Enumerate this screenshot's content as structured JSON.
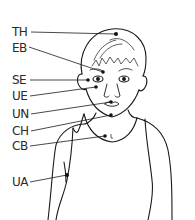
{
  "diagram": {
    "line_color": "#1a1a1a",
    "points": [
      {
        "label": "TH",
        "label_x": 12,
        "label_y": 26,
        "line_x1": 31,
        "line_y1": 32,
        "dot_x": 116,
        "dot_y": 34
      },
      {
        "label": "EB",
        "label_x": 12,
        "label_y": 42,
        "line_x1": 29,
        "line_y1": 47,
        "dot_x": 103,
        "dot_y": 72
      },
      {
        "label": "SE",
        "label_x": 12,
        "label_y": 74,
        "line_x1": 30,
        "line_y1": 80,
        "dot_x": 88,
        "dot_y": 80
      },
      {
        "label": "UE",
        "label_x": 12,
        "label_y": 90,
        "line_x1": 30,
        "line_y1": 96,
        "dot_x": 96,
        "dot_y": 87
      },
      {
        "label": "UN",
        "label_x": 12,
        "label_y": 106,
        "line_x1": 31,
        "line_y1": 114,
        "dot_x": 111,
        "dot_y": 102
      },
      {
        "label": "CH",
        "label_x": 12,
        "label_y": 125,
        "line_x1": 31,
        "line_y1": 131,
        "dot_x": 111,
        "dot_y": 115
      },
      {
        "label": "CB",
        "label_x": 12,
        "label_y": 140,
        "line_x1": 30,
        "line_y1": 146,
        "dot_x": 105,
        "dot_y": 136
      },
      {
        "label": "UA",
        "label_x": 12,
        "label_y": 176,
        "line_x1": 30,
        "line_y1": 182,
        "dot_x": 67,
        "dot_y": 175
      }
    ]
  }
}
